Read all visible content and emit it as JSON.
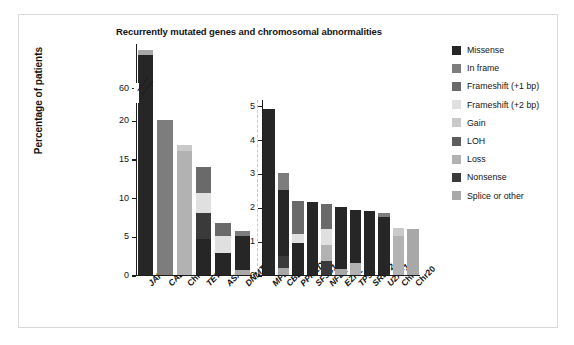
{
  "figure": {
    "title": "Recurrently mutated genes and chromosomal abnormalities",
    "ylabel": "Percentage of patients"
  },
  "legend": {
    "items": [
      {
        "label": "Missense",
        "color": "#262626"
      },
      {
        "label": "In frame",
        "color": "#7d7d7d"
      },
      {
        "label": "Frameshift (+1 bp)",
        "color": "#6a6a6a"
      },
      {
        "label": "Frameshift (+2 bp)",
        "color": "#e0e0e0"
      },
      {
        "label": "Gain",
        "color": "#c9c9c9"
      },
      {
        "label": "LOH",
        "color": "#5d5d5d"
      },
      {
        "label": "Loss",
        "color": "#b2b2b2"
      },
      {
        "label": "Nonsense",
        "color": "#3a3a3a"
      },
      {
        "label": "Splice or other",
        "color": "#a8a8a8"
      }
    ]
  },
  "chart_data": {
    "type": "bar",
    "subtype": "stacked",
    "title": "Recurrently mutated genes and chromosomal abnormalities",
    "xlabel": "",
    "ylabel": "Percentage of patients",
    "grid": false,
    "legend_position": "right",
    "series": [
      {
        "name": "Missense",
        "color": "#262626"
      },
      {
        "name": "In frame",
        "color": "#7d7d7d"
      },
      {
        "name": "Frameshift (+1 bp)",
        "color": "#6a6a6a"
      },
      {
        "name": "Frameshift (+2 bp)",
        "color": "#e0e0e0"
      },
      {
        "name": "Gain",
        "color": "#c9c9c9"
      },
      {
        "name": "LOH",
        "color": "#5d5d5d"
      },
      {
        "name": "Loss",
        "color": "#b2b2b2"
      },
      {
        "name": "Nonsense",
        "color": "#3a3a3a"
      },
      {
        "name": "Splice or other",
        "color": "#a8a8a8"
      }
    ],
    "panels": [
      {
        "id": "left",
        "axis_break": true,
        "break_below": 22.0,
        "break_above": 57.0,
        "ylim_lower": [
          0,
          22.0
        ],
        "ylim_upper": [
          57.0,
          68.0
        ],
        "yticks": [
          0,
          5,
          10,
          15,
          20,
          60
        ],
        "ytick_labels": [
          "0",
          "5",
          "10",
          "15",
          "20",
          "60"
        ],
        "categories": [
          "JAK2",
          "CALR",
          "Chr9",
          "TET2",
          "ASXL1",
          "DNMT3A"
        ],
        "bars": [
          {
            "category": "JAK2",
            "total": 67.5,
            "segments": [
              {
                "name": "Missense",
                "value": 66.5
              },
              {
                "name": "Splice or other",
                "value": 1.0
              }
            ]
          },
          {
            "category": "CALR",
            "total": 20.0,
            "segments": [
              {
                "name": "In frame",
                "value": 20.0
              }
            ]
          },
          {
            "category": "Chr9",
            "total": 16.8,
            "segments": [
              {
                "name": "Loss",
                "value": 16.0
              },
              {
                "name": "Gain",
                "value": 0.8
              }
            ]
          },
          {
            "category": "TET2",
            "total": 14.0,
            "segments": [
              {
                "name": "Missense",
                "value": 4.7
              },
              {
                "name": "Nonsense",
                "value": 3.3
              },
              {
                "name": "Frameshift (+2 bp)",
                "value": 2.6
              },
              {
                "name": "Frameshift (+1 bp)",
                "value": 3.4
              }
            ]
          },
          {
            "category": "ASXL1",
            "total": 6.7,
            "segments": [
              {
                "name": "Missense",
                "value": 2.9
              },
              {
                "name": "Frameshift (+2 bp)",
                "value": 2.1
              },
              {
                "name": "Frameshift (+1 bp)",
                "value": 1.7
              }
            ]
          },
          {
            "category": "DNMT3A",
            "total": 5.7,
            "segments": [
              {
                "name": "Splice or other",
                "value": 0.6
              },
              {
                "name": "Missense",
                "value": 4.4
              },
              {
                "name": "In frame",
                "value": 0.7
              }
            ]
          }
        ]
      },
      {
        "id": "right",
        "axis_break": false,
        "ylim": [
          0,
          5.2
        ],
        "yticks": [
          0,
          1,
          2,
          3,
          4,
          5
        ],
        "ytick_labels": [
          "0",
          "1",
          "2",
          "3",
          "4",
          "5"
        ],
        "categories": [
          "MPL",
          "CBL",
          "PPM1D",
          "SF3B1",
          "NFE2",
          "EZH2",
          "TP53",
          "SRSF2",
          "U2AF1",
          "Chr1",
          "Chr20"
        ],
        "bars": [
          {
            "category": "MPL",
            "total": 4.9,
            "segments": [
              {
                "name": "Missense",
                "value": 4.9
              }
            ]
          },
          {
            "category": "CBL",
            "total": 3.0,
            "segments": [
              {
                "name": "Splice or other",
                "value": 0.2
              },
              {
                "name": "Nonsense",
                "value": 0.35
              },
              {
                "name": "Missense",
                "value": 1.95
              },
              {
                "name": "In frame",
                "value": 0.5
              }
            ]
          },
          {
            "category": "PPM1D",
            "total": 2.2,
            "segments": [
              {
                "name": "Missense",
                "value": 0.95
              },
              {
                "name": "Frameshift (+2 bp)",
                "value": 0.25
              },
              {
                "name": "Frameshift (+1 bp)",
                "value": 1.0
              }
            ]
          },
          {
            "category": "SF3B1",
            "total": 2.15,
            "segments": [
              {
                "name": "Missense",
                "value": 2.15
              }
            ]
          },
          {
            "category": "NFE2",
            "total": 2.1,
            "segments": [
              {
                "name": "Nonsense",
                "value": 0.4
              },
              {
                "name": "Loss",
                "value": 0.5
              },
              {
                "name": "Frameshift (+2 bp)",
                "value": 0.45
              },
              {
                "name": "Frameshift (+1 bp)",
                "value": 0.75
              }
            ]
          },
          {
            "category": "EZH2",
            "total": 2.0,
            "segments": [
              {
                "name": "Splice or other",
                "value": 0.18
              },
              {
                "name": "Missense",
                "value": 1.82
              }
            ]
          },
          {
            "category": "TP53",
            "total": 1.92,
            "segments": [
              {
                "name": "Loss",
                "value": 0.35
              },
              {
                "name": "Missense",
                "value": 1.57
              }
            ]
          },
          {
            "category": "SRSF2",
            "total": 1.88,
            "segments": [
              {
                "name": "Missense",
                "value": 1.88
              }
            ]
          },
          {
            "category": "U2AF1",
            "total": 1.82,
            "segments": [
              {
                "name": "Missense",
                "value": 1.72
              },
              {
                "name": "In frame",
                "value": 0.1
              }
            ]
          },
          {
            "category": "Chr1",
            "total": 1.4,
            "segments": [
              {
                "name": "Loss",
                "value": 1.15
              },
              {
                "name": "Gain",
                "value": 0.25
              }
            ]
          },
          {
            "category": "Chr20",
            "total": 1.35,
            "segments": [
              {
                "name": "Splice or other",
                "value": 1.35
              }
            ]
          }
        ]
      }
    ]
  }
}
